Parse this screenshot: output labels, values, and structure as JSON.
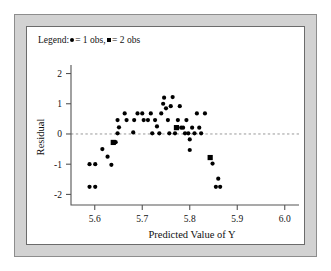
{
  "legend": {
    "prefix": "Legend:",
    "one_obs_label": "= 1 obs,",
    "two_obs_label": "= 2 obs",
    "one_obs_symbol": "circle-marker",
    "two_obs_symbol": "square-marker"
  },
  "chart_data": {
    "type": "scatter",
    "title": "",
    "xlabel": "Predicted Value of Y",
    "ylabel": "Residual",
    "xlim": [
      5.55,
      6.03
    ],
    "ylim": [
      -2.35,
      2.15
    ],
    "xticks": [
      5.6,
      5.7,
      5.8,
      5.9,
      6.0
    ],
    "xticklabels": [
      "5.6",
      "5.7",
      "5.8",
      "5.9",
      "6.0"
    ],
    "yticks": [
      2,
      1,
      0,
      -1,
      -2
    ],
    "yticklabels": [
      "2",
      "1",
      "0",
      "-1",
      "-2"
    ],
    "grid": false,
    "legend_position": "top-left",
    "reference_line": {
      "orientation": "horizontal",
      "y": 0,
      "style": "dashed",
      "color": "#9a9a9a"
    },
    "marker_weights": {
      "circle": 1,
      "square": 2
    },
    "series": [
      {
        "name": "1 obs",
        "marker": "circle",
        "points": [
          [
            5.589,
            -1.0
          ],
          [
            5.601,
            -1.0
          ],
          [
            5.589,
            -1.75
          ],
          [
            5.601,
            -1.75
          ],
          [
            5.616,
            -0.5
          ],
          [
            5.627,
            -0.75
          ],
          [
            5.635,
            -1.02
          ],
          [
            5.644,
            -0.27
          ],
          [
            5.648,
            0.02
          ],
          [
            5.651,
            0.22
          ],
          [
            5.648,
            0.46
          ],
          [
            5.663,
            0.68
          ],
          [
            5.667,
            0.46
          ],
          [
            5.681,
            0.05
          ],
          [
            5.683,
            0.46
          ],
          [
            5.69,
            0.68
          ],
          [
            5.7,
            0.68
          ],
          [
            5.703,
            0.46
          ],
          [
            5.712,
            0.46
          ],
          [
            5.718,
            0.68
          ],
          [
            5.721,
            0.02
          ],
          [
            5.727,
            0.46
          ],
          [
            5.731,
            0.25
          ],
          [
            5.736,
            0.02
          ],
          [
            5.74,
            0.68
          ],
          [
            5.744,
            1.0
          ],
          [
            5.746,
            1.2
          ],
          [
            5.75,
            0.85
          ],
          [
            5.754,
            0.46
          ],
          [
            5.757,
            0.02
          ],
          [
            5.76,
            0.92
          ],
          [
            5.764,
            1.22
          ],
          [
            5.769,
            0.02
          ],
          [
            5.775,
            0.46
          ],
          [
            5.779,
            0.92
          ],
          [
            5.782,
            0.21
          ],
          [
            5.786,
            0.21
          ],
          [
            5.79,
            0.02
          ],
          [
            5.793,
            0.46
          ],
          [
            5.797,
            0.02
          ],
          [
            5.8,
            -0.18
          ],
          [
            5.8,
            -0.53
          ],
          [
            5.805,
            0.21
          ],
          [
            5.81,
            0.02
          ],
          [
            5.815,
            0.68
          ],
          [
            5.82,
            0.21
          ],
          [
            5.824,
            0.02
          ],
          [
            5.832,
            0.68
          ],
          [
            5.848,
            -0.98
          ],
          [
            5.86,
            -1.48
          ],
          [
            5.855,
            -1.75
          ],
          [
            5.864,
            -1.75
          ]
        ]
      },
      {
        "name": "2 obs",
        "marker": "square",
        "points": [
          [
            5.639,
            -0.28
          ],
          [
            5.772,
            0.21
          ],
          [
            5.843,
            -0.78
          ]
        ]
      }
    ]
  }
}
